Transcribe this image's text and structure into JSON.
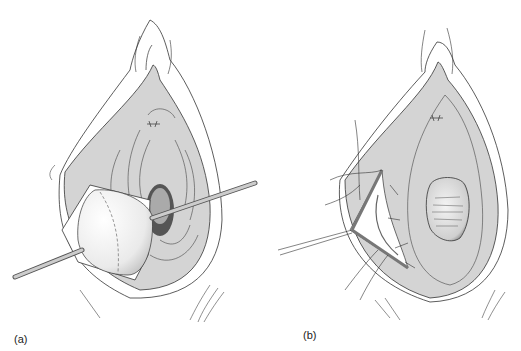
{
  "figure": {
    "panels": [
      {
        "id": "a",
        "label": "(a)",
        "description": "Perineal view with tissue sac retracted by two instruments"
      },
      {
        "id": "b",
        "label": "(b)",
        "description": "Perineal view after excision with sutured incision and retractor"
      }
    ],
    "colors": {
      "tissue_fill": "#d4d4d4",
      "outline": "#333333",
      "highlight": "#f4f4f4",
      "instrument": "#b8b8b8"
    }
  }
}
